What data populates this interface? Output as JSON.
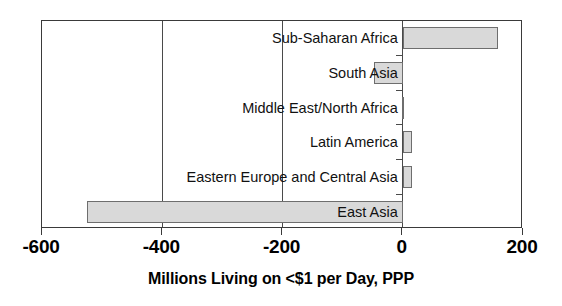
{
  "chart_data": {
    "type": "bar",
    "orientation": "horizontal",
    "title": "",
    "xlabel": "Millions Living on <$1 per Day, PPP",
    "ylabel": "",
    "xlim": [
      -600,
      200
    ],
    "xticks": [
      -600,
      -400,
      -200,
      0,
      200
    ],
    "xticklabels": [
      "-600",
      "-400",
      "-200",
      "0",
      "200"
    ],
    "grid": true,
    "gridlines_at": [
      -400,
      -200,
      0
    ],
    "legend": null,
    "categories": [
      "Sub-Saharan Africa",
      "South Asia",
      "Middle East/North Africa",
      "Latin America",
      "Eastern Europe and Central Asia",
      "East Asia"
    ],
    "values": [
      158,
      -48,
      -2,
      15,
      15,
      -525
    ],
    "series": [
      {
        "name": "Change in millions living on <$1 per day, PPP",
        "values": [
          158,
          -48,
          -2,
          15,
          15,
          -525
        ]
      }
    ],
    "bar_fill_color": "#d9d9d9",
    "bar_edge_color": "#6e6e6e",
    "axis_color": "#3a3a3a"
  },
  "axis": {
    "xlabel": "Millions Living on <$1 per Day, PPP"
  }
}
